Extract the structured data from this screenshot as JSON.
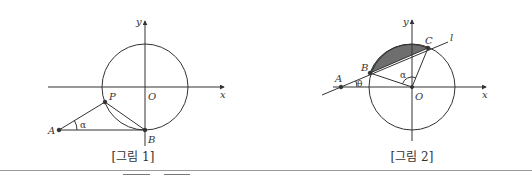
{
  "figures": [
    {
      "caption": "[그림 1]",
      "axis_labels": {
        "x": "x",
        "y": "y",
        "origin": "O"
      },
      "points": {
        "A": "A",
        "B": "B",
        "P": "P"
      },
      "angle_label": "α"
    },
    {
      "caption": "[그림 2]",
      "axis_labels": {
        "x": "x",
        "y": "y",
        "origin": "O"
      },
      "points": {
        "A": "A",
        "B": "B",
        "C": "C"
      },
      "line_label": "l",
      "angle_labels": {
        "alpha": "α",
        "theta": "θ"
      },
      "shaded_region": "circular segment between chord BC and arc",
      "shade_color": "#6e6e6e"
    }
  ],
  "colors": {
    "stroke": "#333333",
    "background": "#ffffff"
  }
}
